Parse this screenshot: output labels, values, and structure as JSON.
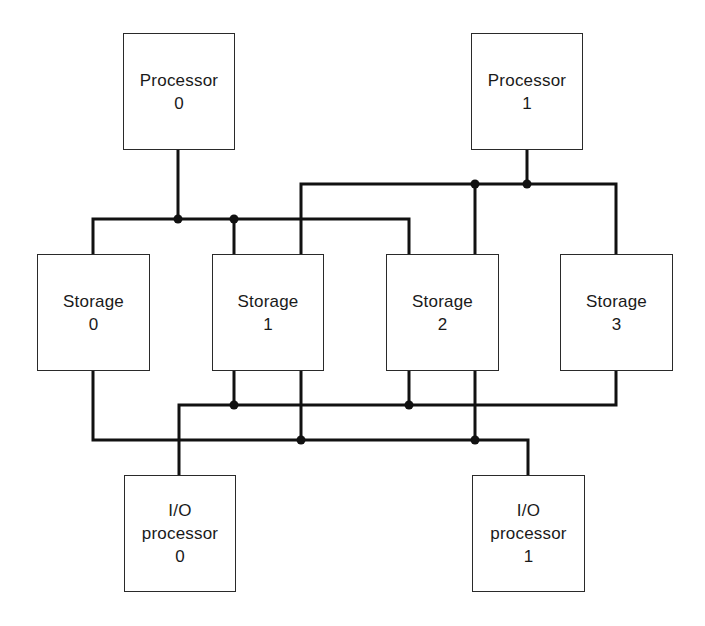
{
  "diagram": {
    "type": "multiprocessor-interconnect",
    "nodes": [
      {
        "id": "processor-0",
        "lines": [
          "Processor",
          "0"
        ],
        "box": {
          "x": 123,
          "y": 33,
          "w": 112,
          "h": 117
        }
      },
      {
        "id": "processor-1",
        "lines": [
          "Processor",
          "1"
        ],
        "box": {
          "x": 471,
          "y": 33,
          "w": 112,
          "h": 117
        }
      },
      {
        "id": "storage-0",
        "lines": [
          "Storage",
          "0"
        ],
        "box": {
          "x": 37,
          "y": 254,
          "w": 113,
          "h": 117
        }
      },
      {
        "id": "storage-1",
        "lines": [
          "Storage",
          "1"
        ],
        "box": {
          "x": 212,
          "y": 254,
          "w": 112,
          "h": 117
        }
      },
      {
        "id": "storage-2",
        "lines": [
          "Storage",
          "2"
        ],
        "box": {
          "x": 386,
          "y": 254,
          "w": 113,
          "h": 117
        }
      },
      {
        "id": "storage-3",
        "lines": [
          "Storage",
          "3"
        ],
        "box": {
          "x": 560,
          "y": 254,
          "w": 113,
          "h": 117
        }
      },
      {
        "id": "io-processor-0",
        "lines": [
          "I/O",
          "processor",
          "0"
        ],
        "box": {
          "x": 124,
          "y": 475,
          "w": 112,
          "h": 117
        }
      },
      {
        "id": "io-processor-1",
        "lines": [
          "I/O",
          "processor",
          "1"
        ],
        "box": {
          "x": 472,
          "y": 475,
          "w": 113,
          "h": 117
        }
      }
    ],
    "buses": [
      {
        "name": "processor-0-bus",
        "from": "processor-0",
        "to": [
          "storage-0",
          "storage-1",
          "storage-2"
        ]
      },
      {
        "name": "processor-1-bus",
        "from": "processor-1",
        "to": [
          "storage-1",
          "storage-2",
          "storage-3"
        ]
      },
      {
        "name": "io-processor-0-bus",
        "from": "io-processor-0",
        "to": [
          "storage-1",
          "storage-2",
          "storage-3"
        ]
      },
      {
        "name": "io-processor-1-bus",
        "from": "io-processor-1",
        "to": [
          "storage-0",
          "storage-1",
          "storage-2"
        ]
      }
    ],
    "colors": {
      "line": "#111111",
      "box_border": "#2a2a2a",
      "background": "#ffffff"
    }
  }
}
